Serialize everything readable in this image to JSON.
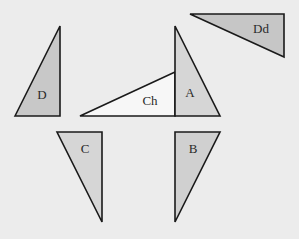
{
  "diagram": {
    "title": "",
    "background": "#ececec",
    "stroke_color": "#1a1a1a",
    "shapes": [
      {
        "id": "D",
        "label": "D",
        "points": "15,116 60,26 60,116",
        "fill": "#c8c8c8",
        "label_x": 42,
        "label_y": 99
      },
      {
        "id": "Ch",
        "label": "Ch",
        "points": "80,116 175,72 175,116",
        "fill": "#f7f7f7",
        "label_x": 150,
        "label_y": 105
      },
      {
        "id": "A",
        "label": "A",
        "points": "175,26 175,116 220,116",
        "fill": "#d6d6d6",
        "label_x": 190,
        "label_y": 97
      },
      {
        "id": "Dd",
        "label": "Dd",
        "points": "190,14 284,14 284,57",
        "fill": "#c6c6c6",
        "label_x": 261,
        "label_y": 33
      },
      {
        "id": "C",
        "label": "C",
        "points": "57,132 102,132 102,222",
        "fill": "#d6d6d6",
        "label_x": 85,
        "label_y": 153
      },
      {
        "id": "B",
        "label": "B",
        "points": "175,132 220,132 175,222",
        "fill": "#d0d0d0",
        "label_x": 193,
        "label_y": 153
      }
    ]
  }
}
